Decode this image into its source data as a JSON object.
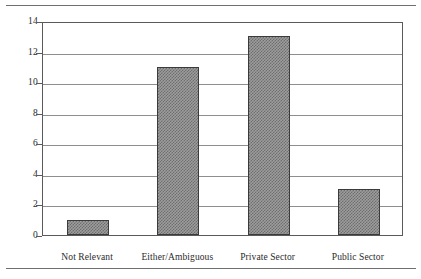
{
  "figure": {
    "background_color": "#ffffff",
    "frame_color": "#5a5a5a",
    "gridline_color": "#8e8e8e",
    "bar_fill_color": "#9d9d9d",
    "bar_hatch_color": "#6e6e6e",
    "bar_border_color": "#3b3b3b",
    "rule_color": "#6f6f6f"
  },
  "chart_data": {
    "type": "bar",
    "title": "",
    "subtitle": "",
    "xlabel": "",
    "ylabel": "",
    "categories": [
      "Not Relevant",
      "Either/Ambiguous",
      "Private Sector",
      "Public Sector"
    ],
    "values": [
      1,
      11,
      13,
      3
    ],
    "ylim": [
      0,
      14
    ],
    "ytick_step": 2,
    "yticks": [
      0,
      2,
      4,
      6,
      8,
      10,
      12,
      14
    ],
    "ytick_labels": [
      "0",
      "2",
      "4",
      "6",
      "8",
      "10",
      "12",
      "14"
    ],
    "grid": true,
    "grid_axis": "y",
    "legend": false,
    "legend_position": "none",
    "annotations": [],
    "bar_style": "hatched-checkerboard"
  }
}
